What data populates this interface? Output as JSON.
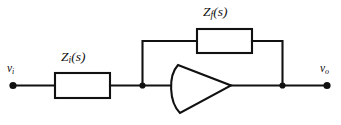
{
  "figure": {
    "name": "inverting-operational-amplifier-circuit",
    "background_color": "#ffffff",
    "line_color": "#111111"
  },
  "labels": {
    "input_impedance": {
      "symbol": "Z",
      "subscript": "i",
      "argument": "(s)",
      "full_text": "Zi(s)"
    },
    "feedback_impedance": {
      "symbol": "Z",
      "subscript": "f",
      "argument": "(s)",
      "full_text": "Zf(s)"
    },
    "input_terminal": {
      "symbol": "v",
      "subscript": "i",
      "full_text": "vi"
    },
    "output_terminal": {
      "symbol": "v",
      "subscript": "o",
      "full_text": "vo"
    }
  },
  "components": {
    "input_impedance_box": {
      "name": "input-impedance-block",
      "x": 55,
      "y": 73,
      "width": 55,
      "height": 25
    },
    "feedback_impedance_box": {
      "name": "feedback-impedance-block",
      "x": 197,
      "y": 29,
      "width": 55,
      "height": 24
    },
    "amplifier": {
      "name": "operational-amplifier",
      "apex_x": 231,
      "apex_y": 85,
      "top_vertex_x": 178,
      "top_vertex_y": 65,
      "bottom_vertex_x": 180,
      "bottom_vertex_y": 113,
      "arc_bulge": "left"
    }
  },
  "nodes": {
    "summing_junction": {
      "name": "summing-junction-node",
      "x": 142,
      "y": 85
    },
    "output_junction": {
      "name": "output-junction-node",
      "x": 283,
      "y": 85
    },
    "input_terminal_dot": {
      "name": "input-terminal-dot",
      "x": 13,
      "y": 85
    },
    "output_terminal_dot": {
      "name": "output-terminal-dot",
      "x": 327,
      "y": 85
    }
  },
  "wires": {
    "main_rail_y": 85,
    "feedback_rail_y": 41,
    "feedback_left_x": 142,
    "feedback_right_x": 283
  }
}
